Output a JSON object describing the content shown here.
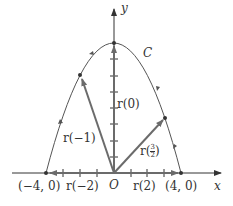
{
  "figure": {
    "axis_x_label": "x",
    "axis_y_label": "y",
    "origin_label": "O",
    "curve_label": "C",
    "points": [
      {
        "label": "(−4, 0)",
        "t": -2,
        "x": -4,
        "y": 0
      },
      {
        "label": "(4, 0)",
        "t": 2,
        "x": 4,
        "y": 0
      }
    ],
    "vectors": [
      {
        "label": "r(0)",
        "t": 0,
        "x": 0,
        "y": 4
      },
      {
        "label": "r(−1)",
        "t": -1,
        "x": -2,
        "y": 3
      },
      {
        "label_prefix": "r",
        "label_frac_num": "3",
        "label_frac_den": "2",
        "t": 1.5,
        "x": 3,
        "y": 1.75
      },
      {
        "label": "r(−2)",
        "t": -2,
        "x": -4,
        "y": 0
      },
      {
        "label": "r(2)",
        "t": 2,
        "x": 4,
        "y": 0
      }
    ],
    "colors": {
      "curve": "#555555",
      "vector": "#6b6b6b",
      "axis": "#333333"
    }
  }
}
